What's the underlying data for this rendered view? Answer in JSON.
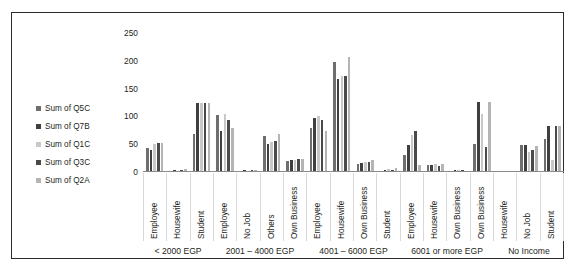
{
  "chart_data": {
    "type": "bar",
    "title": "",
    "subtitle": "",
    "xlabel": "",
    "ylabel": "",
    "ylim": [
      0,
      250
    ],
    "yticks": [
      0,
      50,
      100,
      150,
      200,
      250
    ],
    "grid": false,
    "legend_position": "left",
    "orientation": "vertical",
    "grouping": "clustered",
    "categories": [
      "Employee",
      "Housewife",
      "Student",
      "Employee",
      "No Job",
      "Others",
      "Own Business",
      "Employee",
      "Housewife",
      "Own Business",
      "Student",
      "Employee",
      "Housewife",
      "Own Business",
      "Own Business",
      "Housewife",
      "No Job",
      "Student"
    ],
    "group_labels": [
      {
        "label": "< 2000 EGP",
        "span": 3
      },
      {
        "label": "2001 – 4000 EGP",
        "span": 4
      },
      {
        "label": "4001 – 6000 EGP",
        "span": 4
      },
      {
        "label": "6001 or more EGP",
        "span": 4
      },
      {
        "label": "No Income",
        "span": 3
      }
    ],
    "series": [
      {
        "name": "Sum of Q5C",
        "color": "#6e6e6e",
        "values": [
          43,
          2,
          68,
          103,
          2,
          65,
          19,
          80,
          198,
          15,
          2,
          31,
          13,
          2,
          50,
          1,
          48,
          59
        ]
      },
      {
        "name": "Sum of Q7B",
        "color": "#3f3f3f",
        "values": [
          40,
          3,
          125,
          73,
          3,
          51,
          22,
          98,
          168,
          17,
          4,
          48,
          12,
          3,
          126,
          2,
          48,
          82
        ]
      },
      {
        "name": "Sum of Q1C",
        "color": "#c8c8c8",
        "values": [
          50,
          2,
          124,
          104,
          2,
          54,
          22,
          100,
          172,
          18,
          5,
          67,
          14,
          4,
          105,
          2,
          36,
          22
        ]
      },
      {
        "name": "Sum of Q3C",
        "color": "#4a4a4a",
        "values": [
          53,
          3,
          124,
          93,
          3,
          55,
          23,
          94,
          172,
          18,
          4,
          74,
          11,
          3,
          45,
          2,
          39,
          82
        ]
      },
      {
        "name": "Sum of Q2A",
        "color": "#b4b4b4",
        "values": [
          53,
          5,
          124,
          79,
          4,
          69,
          23,
          74,
          207,
          21,
          7,
          13,
          15,
          2,
          126,
          2,
          46,
          82
        ]
      }
    ]
  }
}
